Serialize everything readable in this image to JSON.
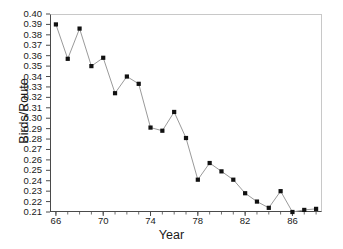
{
  "chart_data": {
    "type": "line",
    "title": "",
    "subtitle": "",
    "xlabel": "Year",
    "ylabel": "Birds/Route",
    "x": [
      66,
      67,
      68,
      69,
      70,
      71,
      72,
      73,
      74,
      75,
      76,
      77,
      78,
      79,
      80,
      81,
      82,
      83,
      84,
      85,
      86,
      87,
      88
    ],
    "values": [
      0.39,
      0.357,
      0.386,
      0.35,
      0.358,
      0.324,
      0.34,
      0.333,
      0.291,
      0.288,
      0.306,
      0.281,
      0.241,
      0.257,
      0.249,
      0.241,
      0.228,
      0.22,
      0.214,
      0.23,
      0.21,
      0.212,
      0.213
    ],
    "series": [
      {
        "name": "Birds/Route",
        "values": [
          0.39,
          0.357,
          0.386,
          0.35,
          0.358,
          0.324,
          0.34,
          0.333,
          0.291,
          0.288,
          0.306,
          0.281,
          0.241,
          0.257,
          0.249,
          0.241,
          0.228,
          0.22,
          0.214,
          0.23,
          0.21,
          0.212,
          0.213
        ],
        "marker": "square",
        "marker_color": "#111111",
        "line_color": "#9a9a9a"
      }
    ],
    "xlim": [
      65.5,
      88.5
    ],
    "ylim": [
      0.21,
      0.4
    ],
    "xticks": [
      66,
      70,
      74,
      78,
      82,
      86
    ],
    "xtick_labels": [
      "66",
      "70",
      "74",
      "78",
      "82",
      "86"
    ],
    "yticks": [
      0.21,
      0.22,
      0.23,
      0.24,
      0.25,
      0.26,
      0.27,
      0.28,
      0.29,
      0.3,
      0.31,
      0.32,
      0.33,
      0.34,
      0.35,
      0.36,
      0.37,
      0.38,
      0.39,
      0.4
    ],
    "ytick_labels": [
      "0.21",
      "0.22",
      "0.23",
      "0.24",
      "0.25",
      "0.26",
      "0.27",
      "0.28",
      "0.29",
      "0.30",
      "0.31",
      "0.32",
      "0.33",
      "0.34",
      "0.35",
      "0.36",
      "0.37",
      "0.38",
      "0.39",
      "0.40"
    ],
    "grid": false,
    "legend": false,
    "legend_position": "none",
    "annotations": [],
    "colors": {
      "background": "#ffffff",
      "axis": "#4a4a4a",
      "frame_light": "#c8c8c8",
      "marker": "#111111",
      "line": "#9a9a9a",
      "text": "#1a1a1a"
    }
  }
}
